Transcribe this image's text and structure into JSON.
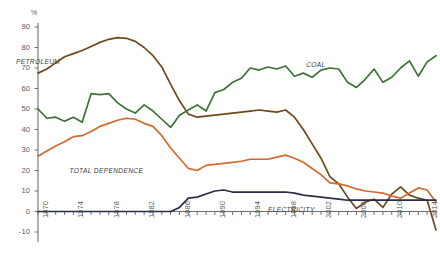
{
  "chart_data": {
    "type": "line",
    "title": "",
    "xlabel": "",
    "ylabel": "%",
    "unit_label": "%",
    "ylim": [
      -10,
      90
    ],
    "yticks": [
      -10,
      0,
      10,
      20,
      30,
      40,
      50,
      60,
      70,
      80,
      90
    ],
    "xlim": [
      1970,
      2015
    ],
    "xticks_labeled": [
      1970,
      1974,
      1978,
      1982,
      1986,
      1990,
      1994,
      1998,
      2002,
      2006,
      2010,
      2014
    ],
    "xtick_step_minor": 1,
    "grid": false,
    "legend_position": "inline-annotations",
    "x": [
      1970,
      1971,
      1972,
      1973,
      1974,
      1975,
      1976,
      1977,
      1978,
      1979,
      1980,
      1981,
      1982,
      1983,
      1984,
      1985,
      1986,
      1987,
      1988,
      1989,
      1990,
      1991,
      1992,
      1993,
      1994,
      1995,
      1996,
      1997,
      1998,
      1999,
      2000,
      2001,
      2002,
      2003,
      2004,
      2005,
      2006,
      2007,
      2008,
      2009,
      2010,
      2011,
      2012,
      2013,
      2014,
      2015
    ],
    "series": [
      {
        "name": "PETROLEUM",
        "color": "#6b4a1e",
        "label_x": 1970,
        "values": [
          67.5,
          69.5,
          72.5,
          75.5,
          77.0,
          78.5,
          80.5,
          82.5,
          84.0,
          84.8,
          84.5,
          83.0,
          80.0,
          76.0,
          70.5,
          62.0,
          54.0,
          47.5,
          46.0,
          46.5,
          47.0,
          47.5,
          48.0,
          48.5,
          49.0,
          49.5,
          49.0,
          48.5,
          49.5,
          46.0,
          40.0,
          33.0,
          26.0,
          17.0,
          13.5,
          7.0,
          1.5,
          4.5,
          6.0,
          2.0,
          8.5,
          12.0,
          8.0,
          6.5,
          5.5,
          -9.0
        ]
      },
      {
        "name": "COAL",
        "color": "#3e7135",
        "label_x": 2001,
        "values": [
          50.0,
          45.5,
          46.0,
          44.0,
          46.0,
          43.5,
          57.5,
          57.0,
          57.5,
          53.0,
          50.0,
          48.0,
          52.0,
          49.0,
          45.0,
          41.0,
          47.0,
          49.5,
          52.0,
          49.0,
          58.0,
          59.5,
          63.0,
          65.0,
          70.0,
          69.0,
          70.5,
          69.5,
          71.0,
          66.0,
          67.5,
          65.5,
          69.0,
          70.0,
          69.5,
          63.0,
          60.5,
          64.5,
          69.5,
          63.0,
          65.5,
          70.0,
          73.5,
          66.0,
          73.0,
          76.0
        ]
      },
      {
        "name": "TOTAL DEPENDENCE",
        "color": "#d2692e",
        "label_x": 1974,
        "values": [
          27.0,
          29.5,
          32.0,
          34.0,
          36.5,
          37.0,
          39.0,
          41.5,
          43.0,
          44.5,
          45.5,
          45.0,
          43.0,
          41.5,
          37.0,
          31.0,
          26.0,
          21.0,
          20.0,
          22.5,
          23.0,
          23.5,
          24.0,
          24.5,
          25.5,
          25.5,
          25.5,
          26.5,
          27.5,
          26.0,
          24.0,
          21.0,
          18.0,
          14.0,
          13.5,
          12.5,
          11.0,
          10.0,
          9.5,
          9.0,
          7.5,
          6.5,
          9.0,
          11.5,
          10.5,
          4.5
        ]
      },
      {
        "name": "ELECTRICITY",
        "color": "#2a2d4a",
        "label_x": 1996,
        "values": [
          0.0,
          0.0,
          0.0,
          0.0,
          0.0,
          0.0,
          0.0,
          0.0,
          0.0,
          0.0,
          0.0,
          0.0,
          0.0,
          0.0,
          0.0,
          0.0,
          2.0,
          6.5,
          7.0,
          8.5,
          10.0,
          10.5,
          9.5,
          9.5,
          9.5,
          9.5,
          9.5,
          9.5,
          9.5,
          9.0,
          8.0,
          7.5,
          7.0,
          6.5,
          6.0,
          5.5,
          5.5,
          5.5,
          5.5,
          5.5,
          5.5,
          5.5,
          5.5,
          5.5,
          5.5,
          5.5
        ]
      }
    ],
    "annotations": [
      {
        "text": "COAL",
        "series": "COAL"
      },
      {
        "text": "PETROLEUM",
        "series": "PETROLEUM"
      },
      {
        "text": "TOTAL DEPENDENCE",
        "series": "TOTAL DEPENDENCE"
      },
      {
        "text": "ELECTRICITY",
        "series": "ELECTRICITY"
      }
    ],
    "axis_color": "#6e6f71",
    "text_color": "#58595b"
  }
}
